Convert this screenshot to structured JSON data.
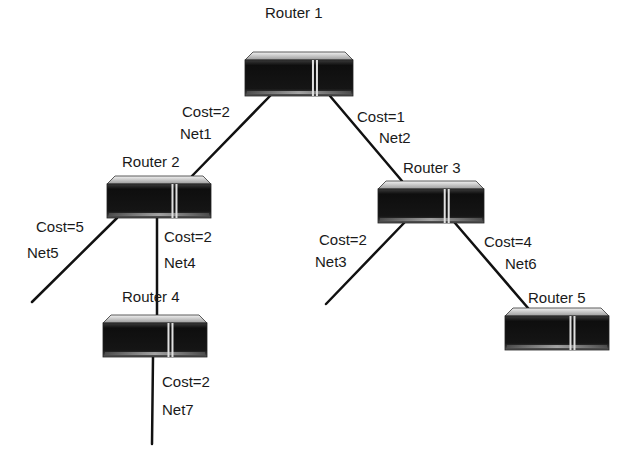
{
  "diagram": {
    "type": "network-topology",
    "colors": {
      "link": "#111111",
      "router_body": "#141414",
      "router_top": "#d8d8d8",
      "router_stripe": "#e0e0e0",
      "text": "#1a1a1a"
    },
    "routers": [
      {
        "id": "r1",
        "label": "Router 1",
        "x": 245,
        "y": 52,
        "w": 108,
        "h": 44,
        "label_x": 265,
        "label_y": 5
      },
      {
        "id": "r2",
        "label": "Router 2",
        "x": 107,
        "y": 176,
        "w": 104,
        "h": 42,
        "label_x": 122,
        "label_y": 154
      },
      {
        "id": "r3",
        "label": "Router 3",
        "x": 378,
        "y": 181,
        "w": 106,
        "h": 42,
        "label_x": 403,
        "label_y": 160
      },
      {
        "id": "r4",
        "label": "Router 4",
        "x": 103,
        "y": 315,
        "w": 104,
        "h": 42,
        "label_x": 122,
        "label_y": 289
      },
      {
        "id": "r5",
        "label": "Router 5",
        "x": 505,
        "y": 308,
        "w": 104,
        "h": 42,
        "label_x": 528,
        "label_y": 290
      }
    ],
    "links": [
      {
        "id": "net1",
        "from": "r1",
        "to": "r2",
        "x1": 270,
        "y1": 96,
        "x2": 192,
        "y2": 176,
        "cost_label": "Cost=2",
        "net_label": "Net1",
        "cost_x": 182,
        "cost_y": 104,
        "net_x": 180,
        "net_y": 126
      },
      {
        "id": "net2",
        "from": "r1",
        "to": "r3",
        "x1": 330,
        "y1": 96,
        "x2": 402,
        "y2": 181,
        "cost_label": "Cost=1",
        "net_label": "Net2",
        "cost_x": 357,
        "cost_y": 109,
        "net_x": 379,
        "net_y": 130
      },
      {
        "id": "net5",
        "from": "r2",
        "to": "stub",
        "x1": 117,
        "y1": 218,
        "x2": 32,
        "y2": 302,
        "cost_label": "Cost=5",
        "net_label": "Net5",
        "cost_x": 36,
        "cost_y": 219,
        "net_x": 27,
        "net_y": 245
      },
      {
        "id": "net4",
        "from": "r2",
        "to": "r4",
        "x1": 157,
        "y1": 218,
        "x2": 157,
        "y2": 315,
        "cost_label": "Cost=2",
        "net_label": "Net4",
        "cost_x": 164,
        "cost_y": 229,
        "net_x": 164,
        "net_y": 255
      },
      {
        "id": "net3",
        "from": "r3",
        "to": "stub",
        "x1": 404,
        "y1": 223,
        "x2": 326,
        "y2": 304,
        "cost_label": "Cost=2",
        "net_label": "Net3",
        "cost_x": 319,
        "cost_y": 232,
        "net_x": 315,
        "net_y": 254
      },
      {
        "id": "net6",
        "from": "r3",
        "to": "r5",
        "x1": 455,
        "y1": 223,
        "x2": 528,
        "y2": 308,
        "cost_label": "Cost=4",
        "net_label": "Net6",
        "cost_x": 484,
        "cost_y": 234,
        "net_x": 505,
        "net_y": 256
      },
      {
        "id": "net7",
        "from": "r4",
        "to": "stub",
        "x1": 153,
        "y1": 357,
        "x2": 152,
        "y2": 444,
        "cost_label": "Cost=2",
        "net_label": "Net7",
        "cost_x": 162,
        "cost_y": 374,
        "net_x": 162,
        "net_y": 402
      }
    ]
  }
}
